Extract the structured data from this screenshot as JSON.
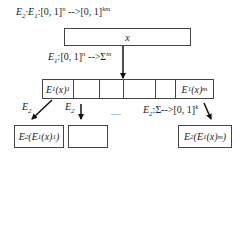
{
  "title_label": {
    "prefix": "E",
    "sub1": "2",
    "mid": "·E",
    "sub2": "1",
    "domain": ":[0, 1]",
    "sup_n": "n",
    "arrow": " -->[0, 1]",
    "sup_km": "km"
  },
  "input_box": {
    "label": "x"
  },
  "e1_label": {
    "prefix": "E",
    "sub": "1",
    "domain": ":[0, 1]",
    "sup_n": "n",
    "arrow": " -->Σ",
    "sup_m": "m"
  },
  "cells": [
    {
      "main": "E",
      "sub1": "1",
      "paren": "(x)",
      "sub2": "1"
    },
    {
      "main": "",
      "sub1": "",
      "paren": "",
      "sub2": ""
    },
    {
      "main": "",
      "sub1": "",
      "paren": "",
      "sub2": ""
    },
    {
      "main": "",
      "sub1": "",
      "paren": "",
      "sub2": ""
    },
    {
      "main": "",
      "sub1": "",
      "paren": "",
      "sub2": ""
    },
    {
      "main": "E",
      "sub1": "1",
      "paren": "(x)",
      "sub2": "m"
    }
  ],
  "arrow_labels": {
    "first": {
      "main": "E",
      "sub": "2"
    },
    "second": {
      "main": "E",
      "sub": "2"
    },
    "ellipsis": ".....",
    "last": {
      "main": "E",
      "sub": "2",
      "rest": ":Σ-->[0, 1]",
      "sup": "k"
    }
  },
  "outputs": [
    {
      "pre": "E",
      "sub1": "2",
      "open": "(E",
      "sub2": "1",
      "mid": "(x)",
      "sub3": "1",
      "close": ")"
    },
    {
      "pre": "",
      "sub1": "",
      "open": "",
      "sub2": "",
      "mid": "",
      "sub3": "",
      "close": ""
    },
    {
      "pre": "E",
      "sub1": "2",
      "open": "(E",
      "sub2": "1",
      "mid": "(x)",
      "sub3": "m",
      "close": ")"
    }
  ]
}
